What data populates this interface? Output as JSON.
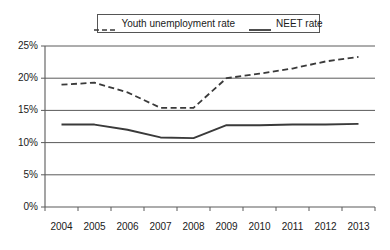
{
  "chart_data": {
    "type": "line",
    "title": "",
    "subtitle": "",
    "xlabel": "",
    "ylabel": "",
    "categories": [
      "2004",
      "2005",
      "2006",
      "2007",
      "2008",
      "2009",
      "2010",
      "2011",
      "2012",
      "2013"
    ],
    "series": [
      {
        "name": "Youth unemployment rate",
        "style": "dashed",
        "color": "#3a3a3a",
        "values": [
          19.0,
          19.3,
          17.8,
          15.4,
          15.4,
          20.0,
          20.7,
          21.5,
          22.6,
          23.3
        ]
      },
      {
        "name": "NEET rate",
        "style": "solid",
        "color": "#3a3a3a",
        "values": [
          12.8,
          12.8,
          12.0,
          10.8,
          10.7,
          12.7,
          12.7,
          12.8,
          12.8,
          12.9
        ]
      }
    ],
    "ylim": [
      0,
      25
    ],
    "yticks": [
      0,
      5,
      10,
      15,
      20,
      25
    ],
    "ytick_labels": [
      "0%",
      "5%",
      "10%",
      "15%",
      "20%",
      "25%"
    ],
    "grid": "horizontal",
    "legend_position": "top-center"
  },
  "legend": {
    "entries": [
      {
        "label": "Youth unemployment rate",
        "icon": "dashed-line-swatch"
      },
      {
        "label": "NEET rate",
        "icon": "solid-line-swatch"
      }
    ]
  },
  "axes": {
    "y_labels": [
      "25%",
      "20%",
      "15%",
      "10%",
      "5%",
      "0%"
    ],
    "x_labels": [
      "2004",
      "2005",
      "2006",
      "2007",
      "2008",
      "2009",
      "2010",
      "2011",
      "2012",
      "2013"
    ]
  },
  "colors": {
    "line": "#3a3a3a",
    "grid": "#5a5a5a",
    "axis": "#5a5a5a",
    "text": "#1a1a1a",
    "background": "#ffffff"
  }
}
